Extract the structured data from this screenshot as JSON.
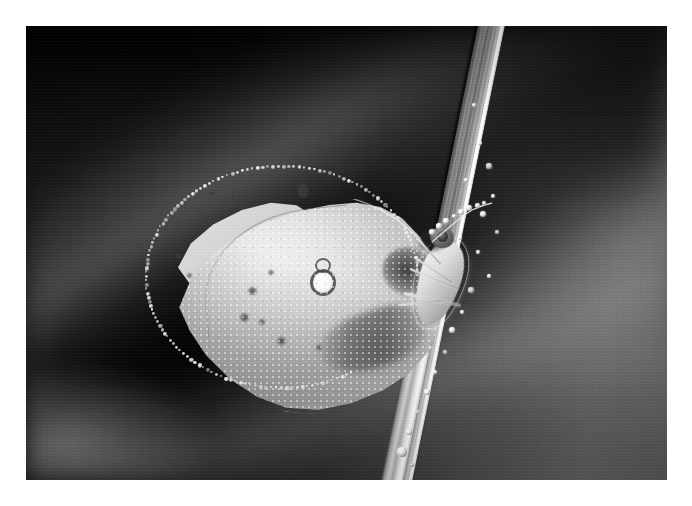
{
  "image": {
    "title": "Butterfly resting on a dew-covered grass blade",
    "medium": "black and white macro photograph",
    "orientation": "landscape",
    "border": {
      "color": "#ffffff",
      "style": "white photographic margin"
    },
    "canvas": {
      "width": 692,
      "height": 506
    },
    "photo_rect": {
      "x": 26,
      "y": 26,
      "width": 641,
      "height": 454
    }
  },
  "palette": {
    "paper_white": "#ffffff",
    "background_dark": "#1a1a1a",
    "background_mid": "#4c4c4c",
    "background_light": "#6b6b6b",
    "wing_highlight": "#f1f1f1",
    "wing_midtone": "#cfcfcf",
    "wing_shadow": "#8c8c8c",
    "marking_dark": "#3c3c3c",
    "blade_highlight": "#f4f4f4",
    "dew_white": "#ffffff"
  },
  "subjects": {
    "butterfly": {
      "label": "butterfly",
      "common_description": "pale sulphur-type butterfly with wings closed",
      "posture": "perched head-up, wings folded vertically, clinging to the grass stem",
      "parts": [
        {
          "name": "forewing",
          "tone": "pale grey-white, covered in fine dew beads"
        },
        {
          "name": "hindwing",
          "tone": "slightly paler sliver visible along the upper edge"
        },
        {
          "name": "discal-spot",
          "tone": "dark figure-eight ring with a bright white centre"
        },
        {
          "name": "dusky-wedge",
          "tone": "soft brown-grey shading across the lower wing"
        },
        {
          "name": "apical-blotch",
          "tone": "dark smudge near the wing base"
        },
        {
          "name": "thorax",
          "tone": "furry pale body"
        },
        {
          "name": "head",
          "tone": "dark rounded head with a large compound eye"
        },
        {
          "name": "antenna",
          "tone": "fine antenna strung with round dew droplets"
        },
        {
          "name": "legs",
          "tone": "thin pale legs gripping the blade"
        },
        {
          "name": "wing-fringe",
          "tone": "bright beaded fringe along the whole wing margin"
        }
      ]
    },
    "grass_blade": {
      "label": "grass blade",
      "description": "a single blade of grass running diagonally from upper right to lower centre",
      "angle_degrees": 11.5,
      "features": [
        "bright specular highlight along the right edge",
        "fine longitudinal veins",
        "a line of round dew droplets clinging to the surface",
        "a large pendant droplet near the lower tip"
      ]
    },
    "background": {
      "label": "background",
      "description": "heavily out-of-focus dark foliage with soft diagonal bands of light",
      "notes": [
        "deep near-black in the upper left and across the top",
        "broad soft light band running diagonally through the upper left",
        "second light band sweeping through the lower left",
        "open mid-grey tone on the right side behind the blade"
      ]
    }
  },
  "spots": {
    "wing_markings": [
      {
        "x": 207,
        "y": 190,
        "w": 9,
        "h": 7
      },
      {
        "x": 230,
        "y": 196,
        "w": 7,
        "h": 6
      },
      {
        "x": 298,
        "y": 184,
        "w": 10,
        "h": 14
      },
      {
        "x": 248,
        "y": 287,
        "w": 9,
        "h": 8
      },
      {
        "x": 240,
        "y": 313,
        "w": 9,
        "h": 9
      },
      {
        "x": 259,
        "y": 319,
        "w": 6,
        "h": 6
      },
      {
        "x": 277,
        "y": 337,
        "w": 9,
        "h": 8
      },
      {
        "x": 268,
        "y": 270,
        "w": 6,
        "h": 5
      },
      {
        "x": 187,
        "y": 273,
        "w": 5,
        "h": 5
      },
      {
        "x": 176,
        "y": 253,
        "w": 5,
        "h": 5
      },
      {
        "x": 316,
        "y": 345,
        "w": 6,
        "h": 5
      }
    ],
    "blade_dew": [
      {
        "x": 474,
        "y": 105,
        "r": 2.1
      },
      {
        "x": 480,
        "y": 143,
        "r": 1.8
      },
      {
        "x": 489,
        "y": 166,
        "r": 2.6
      },
      {
        "x": 493,
        "y": 196,
        "r": 2.2
      },
      {
        "x": 483,
        "y": 214,
        "r": 3.0
      },
      {
        "x": 497,
        "y": 232,
        "r": 2.0
      },
      {
        "x": 478,
        "y": 252,
        "r": 2.4
      },
      {
        "x": 489,
        "y": 276,
        "r": 1.9
      },
      {
        "x": 471,
        "y": 290,
        "r": 2.8
      },
      {
        "x": 462,
        "y": 312,
        "r": 2.2
      },
      {
        "x": 452,
        "y": 330,
        "r": 3.4
      },
      {
        "x": 445,
        "y": 352,
        "r": 2.3
      },
      {
        "x": 435,
        "y": 372,
        "r": 2.0
      },
      {
        "x": 427,
        "y": 392,
        "r": 3.1
      },
      {
        "x": 418,
        "y": 412,
        "r": 2.4
      },
      {
        "x": 409,
        "y": 432,
        "r": 2.8
      },
      {
        "x": 402,
        "y": 452,
        "r": 4.6
      },
      {
        "x": 412,
        "y": 465,
        "r": 2.0
      },
      {
        "x": 466,
        "y": 180,
        "r": 1.6
      },
      {
        "x": 460,
        "y": 238,
        "r": 1.7
      },
      {
        "x": 440,
        "y": 308,
        "r": 1.6
      },
      {
        "x": 430,
        "y": 348,
        "r": 1.8
      }
    ],
    "antenna_dew": [
      {
        "x": 2,
        "y": 30,
        "r": 3.0
      },
      {
        "x": 9,
        "y": 24,
        "r": 2.6
      },
      {
        "x": 16,
        "y": 19,
        "r": 2.8
      },
      {
        "x": 24,
        "y": 14,
        "r": 2.4
      },
      {
        "x": 31,
        "y": 10,
        "r": 3.1
      },
      {
        "x": 39,
        "y": 6,
        "r": 2.7
      },
      {
        "x": 47,
        "y": 3,
        "r": 2.5
      },
      {
        "x": 54,
        "y": 1,
        "r": 2.2
      }
    ]
  }
}
